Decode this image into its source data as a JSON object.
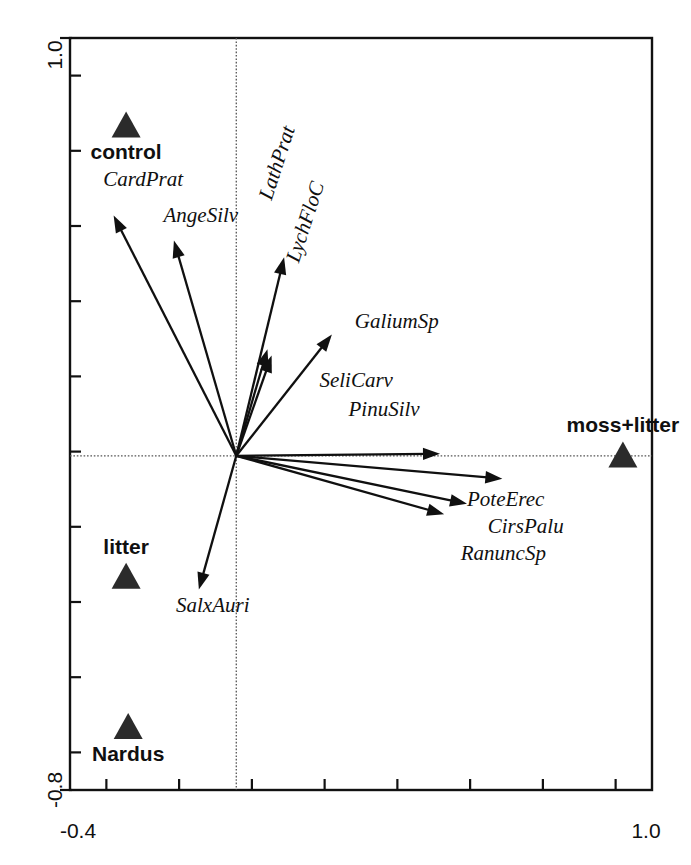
{
  "chart_data": {
    "type": "scatter",
    "title": "",
    "subtitle": "",
    "xlabel": "",
    "ylabel": "",
    "xlim": [
      -0.4,
      1.0
    ],
    "ylim": [
      -0.8,
      1.0
    ],
    "grid": false,
    "legend_position": "none",
    "axis": {
      "x_tick_labels": [
        "-0.4",
        "1.0"
      ],
      "y_tick_labels": [
        "1.0",
        "-0.8"
      ],
      "x_tick_count": 8,
      "y_tick_count": 10,
      "zero_lines": true
    },
    "species_arrows": [
      {
        "name": "CardPrat",
        "x": -0.295,
        "y": 0.575,
        "label_x": -0.32,
        "label_y": 0.645
      },
      {
        "name": "AngeSilv",
        "x": -0.15,
        "y": 0.515,
        "label_x": -0.175,
        "label_y": 0.56
      },
      {
        "name": "LathPrat",
        "x": 0.115,
        "y": 0.475,
        "label_x": 0.085,
        "label_y": 0.61
      },
      {
        "name": "LychFloC",
        "x": 0.075,
        "y": 0.255,
        "label_x": 0.15,
        "label_y": 0.46
      },
      {
        "name": "SeliCarv",
        "x": 0.085,
        "y": 0.24,
        "label_x": 0.2,
        "label_y": 0.165
      },
      {
        "name": "GaliumSp",
        "x": 0.23,
        "y": 0.29,
        "label_x": 0.285,
        "label_y": 0.305
      },
      {
        "name": "PinuSilv",
        "x": 0.49,
        "y": 0.005,
        "label_x": 0.27,
        "label_y": 0.095
      },
      {
        "name": "PoteErec",
        "x": 0.64,
        "y": -0.055,
        "label_x": 0.555,
        "label_y": -0.12
      },
      {
        "name": "CirsPalu",
        "x": 0.555,
        "y": -0.115,
        "label_x": 0.605,
        "label_y": -0.185
      },
      {
        "name": "RanuncSp",
        "x": 0.5,
        "y": -0.14,
        "label_x": 0.54,
        "label_y": -0.25
      },
      {
        "name": "SalxAuri",
        "x": -0.09,
        "y": -0.32,
        "label_x": -0.145,
        "label_y": -0.375
      }
    ],
    "site_markers": [
      {
        "name": "control",
        "x": -0.265,
        "y": 0.79,
        "label_position": "below"
      },
      {
        "name": "moss+litter",
        "x": 0.93,
        "y": 0.0,
        "label_position": "above"
      },
      {
        "name": "litter",
        "x": -0.265,
        "y": -0.29,
        "label_position": "above"
      },
      {
        "name": "Nardus",
        "x": -0.26,
        "y": -0.65,
        "label_position": "below"
      }
    ],
    "colors": {
      "marker": "#2b2b2b",
      "arrow": "#101010",
      "frame": "#111111",
      "zero_line": "#555555",
      "background": "#ffffff"
    }
  }
}
